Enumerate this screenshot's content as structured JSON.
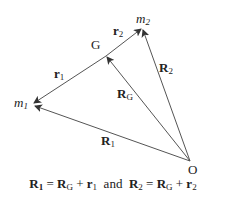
{
  "diagram": {
    "type": "vector-diagram",
    "points": {
      "m1": {
        "label_main": "m",
        "label_sub": "1"
      },
      "m2": {
        "label_main": "m",
        "label_sub": "2"
      },
      "G": {
        "label": "G"
      },
      "O": {
        "label": "O"
      }
    },
    "vectors": {
      "r1": {
        "main": "r",
        "sub": "1"
      },
      "r2": {
        "main": "r",
        "sub": "2"
      },
      "RG": {
        "main": "R",
        "sub": "G"
      },
      "R1": {
        "main": "R",
        "sub": "1"
      },
      "R2": {
        "main": "R",
        "sub": "2"
      }
    },
    "equation": {
      "p1": "R",
      "p1_sub": "1",
      "eq1": " = ",
      "p2": "R",
      "p2_sub": "G",
      "plus1": " + ",
      "p3": "r",
      "p3_sub": "1",
      "and": "  and  ",
      "p4": "R",
      "p4_sub": "2",
      "eq2": " = ",
      "p5": "R",
      "p5_sub": "G",
      "plus2": " + ",
      "p6": "r",
      "p6_sub": "2"
    },
    "line_color": "#555555"
  }
}
